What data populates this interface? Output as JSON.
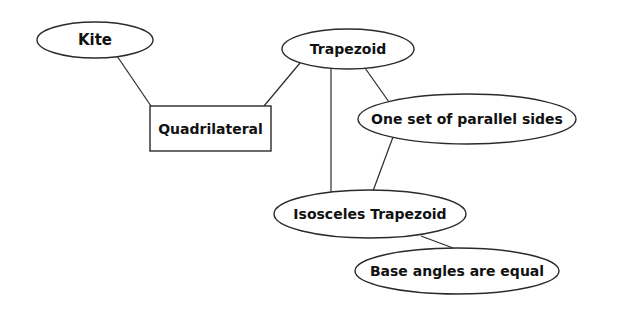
{
  "diagram": {
    "type": "concept-map",
    "nodes": [
      {
        "id": "kite",
        "label": "Kite",
        "shape": "ellipse",
        "cx": 95,
        "cy": 40,
        "rx": 58,
        "ry": 18,
        "font_size": 15
      },
      {
        "id": "quadrilateral",
        "label": "Quadrilateral",
        "shape": "rect",
        "x": 150,
        "y": 106,
        "w": 121,
        "h": 45,
        "font_size": 14
      },
      {
        "id": "trapezoid",
        "label": "Trapezoid",
        "shape": "ellipse",
        "cx": 348,
        "cy": 49,
        "rx": 66,
        "ry": 20,
        "font_size": 14
      },
      {
        "id": "one_set_parallel",
        "label": "One set of parallel sides",
        "shape": "ellipse",
        "cx": 467,
        "cy": 119,
        "rx": 109,
        "ry": 25,
        "font_size": 14
      },
      {
        "id": "isosceles_trapezoid",
        "label": "Isosceles Trapezoid",
        "shape": "ellipse",
        "cx": 370,
        "cy": 214,
        "rx": 96,
        "ry": 24,
        "font_size": 14
      },
      {
        "id": "base_angles_equal",
        "label": "Base angles are equal",
        "shape": "ellipse",
        "cx": 457,
        "cy": 271,
        "rx": 102,
        "ry": 23,
        "font_size": 14
      }
    ],
    "edges": [
      {
        "from": "kite",
        "to": "quadrilateral",
        "x1": 117,
        "y1": 56,
        "x2": 151,
        "y2": 106
      },
      {
        "from": "quadrilateral",
        "to": "trapezoid",
        "x1": 264,
        "y1": 106,
        "x2": 300,
        "y2": 63
      },
      {
        "from": "trapezoid",
        "to": "isosceles_trapezoid",
        "x1": 331,
        "y1": 69,
        "x2": 331,
        "y2": 192
      },
      {
        "from": "trapezoid",
        "to": "one_set_parallel",
        "x1": 365,
        "y1": 68,
        "x2": 389,
        "y2": 102
      },
      {
        "from": "one_set_parallel",
        "to": "isosceles_trapezoid",
        "x1": 393,
        "y1": 137,
        "x2": 373,
        "y2": 191
      },
      {
        "from": "isosceles_trapezoid",
        "to": "base_angles_equal",
        "x1": 421,
        "y1": 236,
        "x2": 453,
        "y2": 248
      }
    ]
  }
}
